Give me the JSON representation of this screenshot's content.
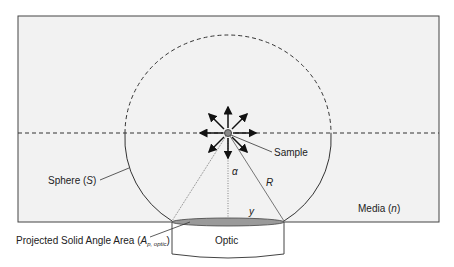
{
  "diagram": {
    "labels": {
      "sample": "Sample",
      "alpha": "α",
      "radius": "R",
      "y": "y",
      "media": "Media (",
      "media_var": "n",
      "media_close": ")",
      "sphere": "Sphere (",
      "sphere_var": "S",
      "sphere_close": ")",
      "projected_area": "Projected Solid Angle Area (",
      "projected_var": "A",
      "projected_sub": "p, optic",
      "projected_close": ")",
      "optic": "Optic"
    },
    "colors": {
      "media_fill": "#f2f2f2",
      "stroke": "#333333",
      "ellipse_fill": "#9a9a9a"
    }
  }
}
